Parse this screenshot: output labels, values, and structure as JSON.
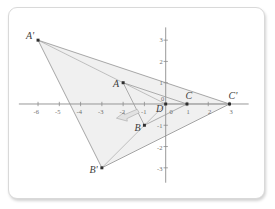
{
  "figure": {
    "background": "#ffffff",
    "card_border_color": "#d9d9d9"
  },
  "chart_data": {
    "type": "scatter",
    "title": "",
    "xlabel": "",
    "ylabel": "",
    "xlim": [
      -6.9,
      3.9
    ],
    "ylim": [
      -3.7,
      3.6
    ],
    "grid": false,
    "axis_color": "#8c8c8c",
    "xticks": [
      -6,
      -5,
      -4,
      -3,
      -2,
      -1,
      0,
      1,
      2,
      3
    ],
    "xtick_labels": [
      "-6",
      "-5",
      "-4",
      "-3",
      "-2",
      "-1",
      "0",
      "1",
      "2",
      "3"
    ],
    "yticks": [
      -3,
      -2,
      -1,
      0,
      1,
      2,
      3
    ],
    "ytick_labels": [
      "-3",
      "-2",
      "-1",
      "0",
      "1",
      "2",
      "3"
    ],
    "points": [
      {
        "name": "A",
        "label": "A",
        "x": -2,
        "y": 1,
        "label_dx": -11,
        "label_dy": -5
      },
      {
        "name": "B",
        "label": "B",
        "x": -1,
        "y": -1,
        "label_dx": -11,
        "label_dy": -4
      },
      {
        "name": "C",
        "label": "C",
        "x": 1,
        "y": 0,
        "label_dx": -3,
        "label_dy": -14
      },
      {
        "name": "D",
        "label": "D",
        "x": 0,
        "y": 0,
        "label_dx": -11,
        "label_dy": -1
      },
      {
        "name": "Aprime",
        "label": "A'",
        "x": -6,
        "y": 3,
        "label_dx": -12,
        "label_dy": -10
      },
      {
        "name": "Bprime",
        "label": "B'",
        "x": -3,
        "y": -3,
        "label_dx": -13,
        "label_dy": -5
      },
      {
        "name": "Cprime",
        "label": "C'",
        "x": 3,
        "y": 0,
        "label_dx": -3,
        "label_dy": -14
      }
    ],
    "series": [
      {
        "name": "preimage-triangle",
        "type": "polygon",
        "vertices": [
          "A",
          "B",
          "C"
        ],
        "x": [
          -2,
          -1,
          1
        ],
        "y": [
          1,
          -1,
          0
        ],
        "fill": "none",
        "stroke": "#9a9a9a"
      },
      {
        "name": "image-triangle",
        "type": "polygon",
        "vertices": [
          "A'",
          "B'",
          "C'"
        ],
        "x": [
          -6,
          -3,
          3
        ],
        "y": [
          3,
          -3,
          0
        ],
        "fill": "#f0f0f0",
        "stroke": "#8f8f8f"
      }
    ],
    "rays": [
      {
        "name": "ray-D-to-Aprime",
        "from": [
          0,
          0
        ],
        "to": [
          -6,
          3
        ]
      },
      {
        "name": "ray-D-to-Bprime",
        "from": [
          0,
          0
        ],
        "to": [
          -3,
          -3
        ]
      },
      {
        "name": "ray-D-to-Cprime",
        "from": [
          0,
          0
        ],
        "to": [
          3,
          0
        ]
      }
    ],
    "annotations": [
      {
        "name": "cursor-arrow",
        "kind": "arrow-glyph",
        "x": -1.85,
        "y": -0.48,
        "direction": "left-down",
        "color": "#c9c9c9"
      }
    ],
    "scale_factor": 3,
    "center_of_dilation": "D"
  }
}
